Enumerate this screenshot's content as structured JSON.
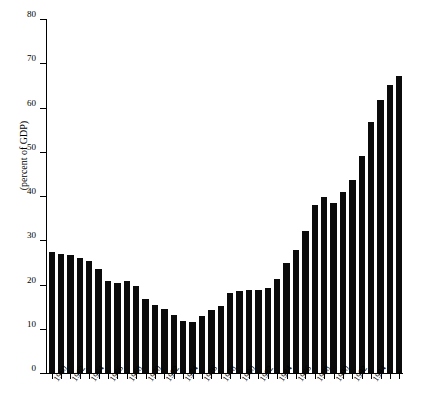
{
  "chart_data": {
    "type": "bar",
    "title": "",
    "subtitle": "",
    "xlabel": "",
    "ylabel": "(percent of GDP)",
    "ylim": [
      0,
      80
    ],
    "yticks": [
      0,
      10,
      20,
      30,
      40,
      50,
      60,
      70,
      80
    ],
    "grid": false,
    "legend": null,
    "bar_color": "#0b0b0b",
    "categories": [
      "1960",
      "1961",
      "1962",
      "1963",
      "1964",
      "1965",
      "1966",
      "1967",
      "1968",
      "1969",
      "1970",
      "1971",
      "1972",
      "1973",
      "1974",
      "1975",
      "1976",
      "1977",
      "1978",
      "1979",
      "1980",
      "1981",
      "1982",
      "1983",
      "1984",
      "1985",
      "1986",
      "1987",
      "1988",
      "1989",
      "1990",
      "1991",
      "1992",
      "1993",
      "1994",
      "1995"
    ],
    "xtick_labels": [
      "1960",
      "1962",
      "1964",
      "1966",
      "1968",
      "1970",
      "1972",
      "1974",
      "1976",
      "1978",
      "1980",
      "1982",
      "1984",
      "1986",
      "1988",
      "1990",
      "1992",
      "1994"
    ],
    "xtick_label_step_years": 2,
    "values": [
      27.4,
      27.0,
      26.7,
      26.0,
      25.4,
      23.4,
      20.8,
      20.4,
      20.7,
      19.7,
      16.8,
      15.4,
      14.5,
      13.0,
      11.8,
      11.5,
      12.8,
      14.3,
      15.2,
      18.0,
      18.5,
      18.7,
      18.8,
      19.1,
      21.3,
      24.9,
      27.9,
      32.2,
      38.0,
      39.7,
      38.5,
      41.0,
      43.7,
      49.1,
      56.7,
      61.6
    ],
    "values_tail_note": "",
    "extra_values": [
      65.0,
      67.2
    ]
  }
}
